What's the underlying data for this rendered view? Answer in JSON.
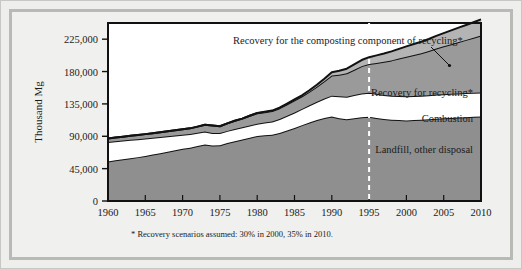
{
  "figure": {
    "background_color": "#eeeeec",
    "frame_color": "#b9b9b6",
    "plot_background": "#ffffff"
  },
  "axes": {
    "y_axis_title": "Thousand Mg",
    "y_ticks": [
      "0",
      "45,000",
      "90,000",
      "135,000",
      "180,000",
      "225,000"
    ],
    "y_tick_values": [
      0,
      45000,
      90000,
      135000,
      180000,
      225000
    ],
    "x_ticks": [
      "1960",
      "1965",
      "1970",
      "1975",
      "1980",
      "1985",
      "1990",
      "1995",
      "2000",
      "2005",
      "2010"
    ],
    "x_tick_values": [
      1960,
      1965,
      1970,
      1975,
      1980,
      1985,
      1990,
      1995,
      2000,
      2005,
      2010
    ]
  },
  "annotations": {
    "composting": "Recovery for the composting component of recycling*",
    "recycling": "Recovery for recycling*",
    "combustion": "Combustion",
    "landfill": "Landfill, other disposal",
    "footnote": "* Recovery scenarios assumed: 30% in 2000, 35% in 2010.",
    "projection_marker_year": "1995"
  },
  "colors": {
    "landfill_fill": "#8f8f8f",
    "combustion_fill": "#ffffff",
    "recycling_fill": "#9a9a9a",
    "composting_fill": "#b4b4b4",
    "line_color": "#111111",
    "projection_dash": "#ffffff",
    "plot_white": "#ffffff"
  },
  "chart_data": {
    "type": "area",
    "stacked": true,
    "title": "",
    "xlabel": "",
    "ylabel": "Thousand Mg",
    "xlim": [
      1960,
      2010
    ],
    "ylim": [
      0,
      247500
    ],
    "grid": false,
    "legend_position": "inline-labels",
    "axis_tick_interval_x": 5,
    "axis_tick_interval_y": 45000,
    "projection_start_year": 1995,
    "footnote": "* Recovery scenarios assumed: 30% in 2000, 35% in 2010.",
    "x": [
      1960,
      1961,
      1962,
      1963,
      1964,
      1965,
      1966,
      1967,
      1968,
      1969,
      1970,
      1971,
      1972,
      1973,
      1974,
      1975,
      1976,
      1977,
      1978,
      1979,
      1980,
      1981,
      1982,
      1983,
      1984,
      1985,
      1986,
      1987,
      1988,
      1989,
      1990,
      1991,
      1992,
      1993,
      1994,
      1995,
      1996,
      1997,
      1998,
      1999,
      2000,
      2001,
      2002,
      2003,
      2004,
      2005,
      2006,
      2007,
      2008,
      2009,
      2010
    ],
    "series": [
      {
        "name": "Landfill, other disposal",
        "fill": "#8f8f8f",
        "values": [
          55000,
          56500,
          58000,
          59500,
          61000,
          62500,
          64500,
          66500,
          68500,
          70500,
          72500,
          74000,
          76500,
          78500,
          77000,
          77500,
          80500,
          83000,
          85500,
          88000,
          90500,
          91500,
          92000,
          94500,
          98000,
          101500,
          105500,
          109000,
          112500,
          115500,
          117500,
          115000,
          113500,
          115000,
          116500,
          117000,
          115500,
          114000,
          113000,
          112500,
          112000,
          112500,
          113000,
          113500,
          114500,
          115000,
          115500,
          116000,
          116500,
          117000,
          117500
        ]
      },
      {
        "name": "Combustion",
        "fill": "#ffffff",
        "values": [
          27000,
          26500,
          26000,
          25500,
          25000,
          24500,
          23500,
          22500,
          21500,
          20500,
          19500,
          19000,
          18500,
          18000,
          17500,
          17000,
          17000,
          17000,
          17000,
          17000,
          17000,
          17500,
          18500,
          19500,
          20500,
          21500,
          22500,
          24000,
          25500,
          27000,
          29000,
          30500,
          31500,
          32500,
          33000,
          33500,
          33500,
          33500,
          33500,
          33500,
          33500,
          33500,
          33500,
          33500,
          33500,
          33500,
          33500,
          33500,
          33500,
          33500,
          33500
        ]
      },
      {
        "name": "Recovery for recycling*",
        "fill": "#9a9a9a",
        "values": [
          5000,
          5200,
          5400,
          5600,
          5800,
          6000,
          6300,
          6600,
          7000,
          7400,
          7800,
          8000,
          8400,
          9500,
          10500,
          9500,
          10500,
          11500,
          12000,
          13500,
          14500,
          14500,
          14500,
          15000,
          16000,
          17000,
          17500,
          19000,
          21000,
          24000,
          28000,
          30000,
          32500,
          35000,
          38000,
          40000,
          43000,
          46000,
          49000,
          52000,
          55000,
          57000,
          59000,
          61500,
          64000,
          66500,
          69000,
          71500,
          74000,
          76500,
          79000
        ]
      },
      {
        "name": "Recovery for the composting component of recycling*",
        "fill": "#b4b4b4",
        "values": [
          0,
          0,
          0,
          0,
          0,
          0,
          0,
          0,
          0,
          0,
          0,
          0,
          0,
          0,
          0,
          0,
          0,
          0,
          0,
          0,
          500,
          600,
          700,
          800,
          1000,
          1200,
          1500,
          2000,
          2600,
          3500,
          4500,
          5500,
          6500,
          7500,
          8500,
          9500,
          10500,
          11500,
          12500,
          13500,
          14500,
          15200,
          16000,
          16800,
          17600,
          18400,
          19200,
          20000,
          20800,
          21600,
          22500
        ]
      }
    ],
    "totals_note": "Stacked totals rise from about 87,000 in 1960 to about 252,000 in 2010"
  }
}
